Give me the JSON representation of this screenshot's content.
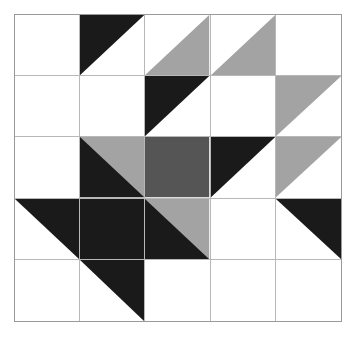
{
  "figure": {
    "kind": "quilt-block-diagram",
    "title": "",
    "background_color": "#ffffff",
    "outer_border_color": "#9a9a9a",
    "grid_line_color": "#b8b8b8",
    "rows": 5,
    "columns": 5
  },
  "palette": {
    "white": "#ffffff",
    "black": "#1a1a1a",
    "light_gray": "#a3a3a3",
    "dark_gray": "#555555"
  },
  "cells": [
    {
      "row": 1,
      "col": 1,
      "name": "cell-r1c1",
      "shapes": [
        {
          "type": "full",
          "color": "#ffffff"
        }
      ]
    },
    {
      "row": 1,
      "col": 2,
      "name": "cell-r1c2",
      "shapes": [
        {
          "type": "full",
          "color": "#ffffff"
        },
        {
          "type": "triangle",
          "corner": "top-left",
          "color": "#1a1a1a"
        }
      ]
    },
    {
      "row": 1,
      "col": 3,
      "name": "cell-r1c3",
      "shapes": [
        {
          "type": "full",
          "color": "#ffffff"
        },
        {
          "type": "triangle",
          "corner": "bottom-right",
          "color": "#a3a3a3"
        }
      ]
    },
    {
      "row": 1,
      "col": 4,
      "name": "cell-r1c4",
      "shapes": [
        {
          "type": "full",
          "color": "#ffffff"
        },
        {
          "type": "triangle",
          "corner": "bottom-right",
          "color": "#a3a3a3"
        }
      ]
    },
    {
      "row": 1,
      "col": 5,
      "name": "cell-r1c5",
      "shapes": [
        {
          "type": "full",
          "color": "#ffffff"
        }
      ]
    },
    {
      "row": 2,
      "col": 1,
      "name": "cell-r2c1",
      "shapes": [
        {
          "type": "full",
          "color": "#ffffff"
        }
      ]
    },
    {
      "row": 2,
      "col": 2,
      "name": "cell-r2c2",
      "shapes": [
        {
          "type": "full",
          "color": "#ffffff"
        }
      ]
    },
    {
      "row": 2,
      "col": 3,
      "name": "cell-r2c3",
      "shapes": [
        {
          "type": "full",
          "color": "#ffffff"
        },
        {
          "type": "triangle",
          "corner": "top-left",
          "color": "#1a1a1a"
        }
      ]
    },
    {
      "row": 2,
      "col": 4,
      "name": "cell-r2c4",
      "shapes": [
        {
          "type": "full",
          "color": "#ffffff"
        }
      ]
    },
    {
      "row": 2,
      "col": 5,
      "name": "cell-r2c5",
      "shapes": [
        {
          "type": "full",
          "color": "#ffffff"
        },
        {
          "type": "triangle",
          "corner": "top-left",
          "color": "#a3a3a3"
        }
      ]
    },
    {
      "row": 3,
      "col": 1,
      "name": "cell-r3c1",
      "shapes": [
        {
          "type": "full",
          "color": "#ffffff"
        }
      ]
    },
    {
      "row": 3,
      "col": 2,
      "name": "cell-r3c2",
      "shapes": [
        {
          "type": "full",
          "color": "#a3a3a3"
        },
        {
          "type": "triangle",
          "corner": "bottom-left",
          "color": "#1a1a1a"
        }
      ]
    },
    {
      "row": 3,
      "col": 3,
      "name": "cell-r3c3",
      "shapes": [
        {
          "type": "full",
          "color": "#555555"
        }
      ]
    },
    {
      "row": 3,
      "col": 4,
      "name": "cell-r3c4",
      "shapes": [
        {
          "type": "full",
          "color": "#ffffff"
        },
        {
          "type": "triangle",
          "corner": "top-left",
          "color": "#1a1a1a"
        }
      ]
    },
    {
      "row": 3,
      "col": 5,
      "name": "cell-r3c5",
      "shapes": [
        {
          "type": "full",
          "color": "#ffffff"
        },
        {
          "type": "triangle",
          "corner": "top-left",
          "color": "#a3a3a3"
        }
      ]
    },
    {
      "row": 4,
      "col": 1,
      "name": "cell-r4c1",
      "shapes": [
        {
          "type": "full",
          "color": "#ffffff"
        },
        {
          "type": "triangle",
          "corner": "top-right",
          "color": "#1a1a1a"
        }
      ]
    },
    {
      "row": 4,
      "col": 2,
      "name": "cell-r4c2",
      "shapes": [
        {
          "type": "full",
          "color": "#1a1a1a"
        }
      ]
    },
    {
      "row": 4,
      "col": 3,
      "name": "cell-r4c3",
      "shapes": [
        {
          "type": "full",
          "color": "#a3a3a3"
        },
        {
          "type": "triangle",
          "corner": "bottom-left",
          "color": "#1a1a1a"
        }
      ]
    },
    {
      "row": 4,
      "col": 4,
      "name": "cell-r4c4",
      "shapes": [
        {
          "type": "full",
          "color": "#ffffff"
        }
      ]
    },
    {
      "row": 4,
      "col": 5,
      "name": "cell-r4c5",
      "shapes": [
        {
          "type": "full",
          "color": "#ffffff"
        },
        {
          "type": "triangle",
          "corner": "top-right",
          "color": "#1a1a1a"
        }
      ]
    },
    {
      "row": 5,
      "col": 1,
      "name": "cell-r5c1",
      "shapes": [
        {
          "type": "full",
          "color": "#ffffff"
        }
      ]
    },
    {
      "row": 5,
      "col": 2,
      "name": "cell-r5c2",
      "shapes": [
        {
          "type": "full",
          "color": "#ffffff"
        },
        {
          "type": "triangle",
          "corner": "top-right",
          "color": "#1a1a1a"
        }
      ]
    },
    {
      "row": 5,
      "col": 3,
      "name": "cell-r5c3",
      "shapes": [
        {
          "type": "full",
          "color": "#ffffff"
        }
      ]
    },
    {
      "row": 5,
      "col": 4,
      "name": "cell-r5c4",
      "shapes": [
        {
          "type": "full",
          "color": "#ffffff"
        }
      ]
    },
    {
      "row": 5,
      "col": 5,
      "name": "cell-r5c5",
      "shapes": [
        {
          "type": "full",
          "color": "#ffffff"
        }
      ]
    }
  ]
}
